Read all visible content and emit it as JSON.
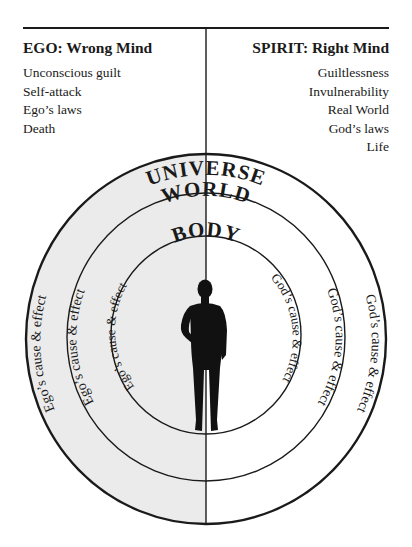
{
  "left_column": {
    "title": "EGO: Wrong Mind",
    "items": [
      "Unconscious guilt",
      "Self-attack",
      "Ego’s laws",
      "Death"
    ]
  },
  "right_column": {
    "title": "SPIRIT: Right Mind",
    "items": [
      "Guiltlessness",
      "Invulnerability",
      "Real World",
      "God’s laws",
      "Life"
    ]
  },
  "rings": {
    "outer_label": "UNIVERSE",
    "middle_label": "WORLD",
    "inner_label": "BODY"
  },
  "left_ring_labels": {
    "outer": "Ego’s cause & effect",
    "middle": "Ego’s cause & effect",
    "inner": "Ego’s cause & effect"
  },
  "right_ring_labels": {
    "outer": "God’s cause & effect",
    "middle": "God’s cause & effect",
    "inner": "God’s cause & effect"
  },
  "center_figure": "human-silhouette",
  "colors": {
    "left_half_fill": "#ebebeb",
    "right_half_fill": "#ffffff",
    "line": "#1a1a1a"
  }
}
